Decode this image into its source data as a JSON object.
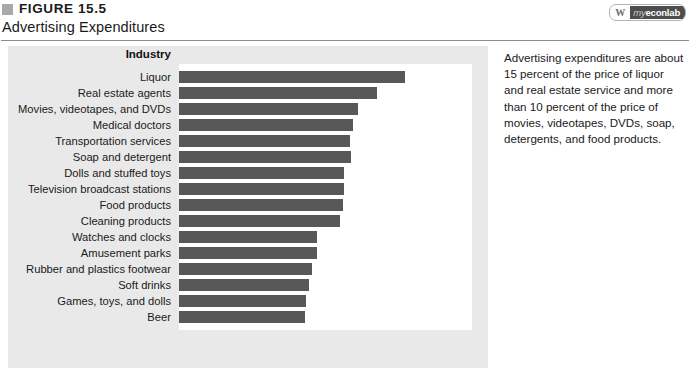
{
  "header": {
    "marker_icon": "gray-square-icon",
    "figure_number": "FIGURE 15.5",
    "title": "Advertising Expenditures"
  },
  "logo": {
    "mark_icon": "w-monogram-icon",
    "my": "my",
    "econ": "econ",
    "lab": "lab",
    "full": "myeconlab"
  },
  "caption": {
    "text": "Advertising expenditures are about 15 percent of the price of liquor and real estate service and more than 10 percent of the price of movies, videotapes, DVDs, soap, detergents, and food products."
  },
  "chart_data": {
    "type": "bar",
    "orientation": "horizontal",
    "title": "Advertising Expenditures",
    "category_axis_title": "Industry",
    "xlabel": "Advertising expenditure (percentage of price)",
    "ylabel": "Industry",
    "xlim": [
      0,
      21.3
    ],
    "xticks": [
      0,
      5,
      10,
      15,
      20
    ],
    "xticklabels": [
      "0",
      "5",
      "10",
      "15",
      "20"
    ],
    "grid": false,
    "legend": false,
    "bar_color": "#585858",
    "plot_background": "#ffffff",
    "panel_background": "#e9e9e9",
    "categories": [
      "Liquor",
      "Real estate agents",
      "Movies, videotapes, and DVDs",
      "Medical doctors",
      "Transportation services",
      "Soap and detergent",
      "Dolls and stuffed toys",
      "Television broadcast stations",
      "Food products",
      "Cleaning products",
      "Watches and clocks",
      "Amusement parks",
      "Rubber and plastics footwear",
      "Soft drinks",
      "Games, toys, and dolls",
      "Beer"
    ],
    "values": [
      16.0,
      14.0,
      12.7,
      12.3,
      12.1,
      12.2,
      11.7,
      11.7,
      11.6,
      11.4,
      9.8,
      9.8,
      9.4,
      9.2,
      9.0,
      8.9
    ]
  }
}
